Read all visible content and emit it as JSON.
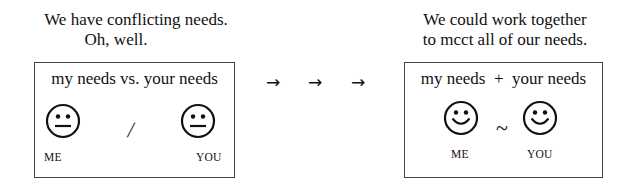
{
  "left_panel": {
    "caption_line1": "We have conflicting needs.",
    "caption_line2": "Oh, well.",
    "box_title": "my needs vs. your needs",
    "separator": "/",
    "face_expression": "neutral",
    "label_me": "ME",
    "label_you": "YOU"
  },
  "arrows": [
    "→",
    "→",
    "→"
  ],
  "right_panel": {
    "caption_line1": "We could work together",
    "caption_line2": "to mcct all of our needs.",
    "box_title": "my needs  +  your needs",
    "separator": "~",
    "face_expression": "smiling",
    "label_me": "ME",
    "label_you": "YOU"
  }
}
